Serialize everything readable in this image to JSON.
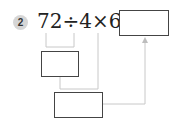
{
  "problem": {
    "number": "2",
    "expression": "72÷4×6=",
    "answer_box_value": "",
    "step1_box_value": "",
    "step2_box_value": ""
  },
  "colors": {
    "badge": "#d6d6d6",
    "connector": "#c8c8c8",
    "box_border": "#444444"
  }
}
